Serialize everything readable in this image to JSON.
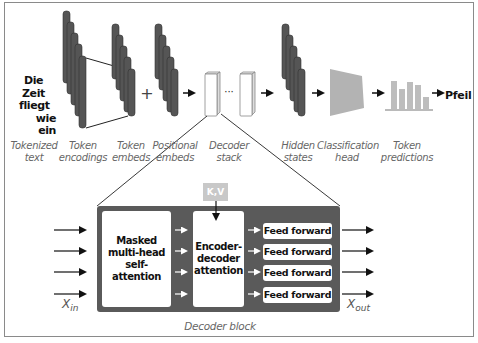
{
  "diagram": {
    "input_words": [
      "Die",
      "Zeit",
      "fliegt",
      "wie",
      "ein"
    ],
    "output_word": "Pfeil",
    "plus_sign": "+",
    "ellipsis": "···",
    "stage_labels": {
      "tokenized_text": [
        "Tokenized",
        "text"
      ],
      "token_encodings": [
        "Token",
        "encodings"
      ],
      "token_embeds": [
        "Token",
        "embeds"
      ],
      "positional_embeds": [
        "Positional",
        "embeds"
      ],
      "decoder_stack": [
        "Decoder",
        "stack"
      ],
      "hidden_states": [
        "Hidden",
        "states"
      ],
      "classification_head": [
        "Classification",
        "head"
      ],
      "token_predictions": [
        "Token",
        "predictions"
      ]
    },
    "decoder_block": {
      "caption": "Decoder block",
      "kv_label": "K,V",
      "self_attention": [
        "Masked",
        "multi-head",
        "self-attention"
      ],
      "cross_attention": [
        "Encoder-",
        "decoder",
        "attention"
      ],
      "feed_forward": [
        "Feed forward",
        "Feed forward",
        "Feed forward",
        "Feed forward"
      ],
      "x_in": {
        "base": "X",
        "sub": "in"
      },
      "x_out": {
        "base": "X",
        "sub": "out"
      }
    },
    "prediction_bars": [
      0.85,
      0.6,
      0.8,
      0.72,
      0.35
    ],
    "colors": {
      "dark_bar": "#555555",
      "block_bg": "#5a5a5a",
      "head_gray": "#b3b3b3",
      "pred_bar": "#bdbdbd",
      "kv_bg": "#c8c8c8",
      "label_gray": "#666666"
    }
  }
}
